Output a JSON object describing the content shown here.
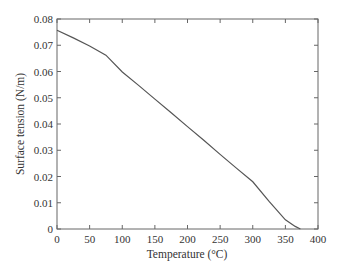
{
  "chart_data": {
    "type": "line",
    "title": "",
    "xlabel": "Temperature (°C)",
    "ylabel": "Surface tension (N/m)",
    "xlim": [
      0,
      400
    ],
    "ylim": [
      0,
      0.08
    ],
    "grid": false,
    "legend": null,
    "x_ticks": [
      0,
      50,
      100,
      150,
      200,
      250,
      300,
      350,
      400
    ],
    "x_tick_labels": [
      "0",
      "50",
      "100",
      "150",
      "200",
      "250",
      "300",
      "350",
      "400"
    ],
    "y_ticks": [
      0,
      0.01,
      0.02,
      0.03,
      0.04,
      0.05,
      0.06,
      0.07,
      0.08
    ],
    "y_tick_labels": [
      "0",
      "0.01",
      "0.02",
      "0.03",
      "0.04",
      "0.05",
      "0.06",
      "0.07",
      "0.08"
    ],
    "series": [
      {
        "name": "Surface tension",
        "color": "#555555",
        "x": [
          0,
          25,
          50,
          75,
          100,
          125,
          150,
          175,
          200,
          225,
          250,
          275,
          300,
          325,
          350,
          365,
          373
        ],
        "y": [
          0.0757,
          0.0728,
          0.0697,
          0.0662,
          0.0598,
          0.0547,
          0.0495,
          0.0443,
          0.039,
          0.0338,
          0.0284,
          0.0232,
          0.018,
          0.0105,
          0.0035,
          0.001,
          0.0
        ]
      }
    ]
  }
}
